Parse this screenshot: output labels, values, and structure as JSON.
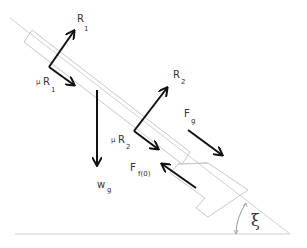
{
  "diagram": {
    "colors": {
      "outline": "#c8c8c8",
      "arrow": "#111111",
      "text": "#333333"
    },
    "angle_label": "ξ",
    "forces": [
      {
        "id": "R1",
        "main": "R",
        "sub": "1"
      },
      {
        "id": "muR1",
        "prefix": "μ",
        "main": "R",
        "sub": "1"
      },
      {
        "id": "wg",
        "main": "w",
        "sub": "g"
      },
      {
        "id": "R2",
        "main": "R",
        "sub": "2"
      },
      {
        "id": "muR2",
        "prefix": "μ",
        "main": "R",
        "sub": "2"
      },
      {
        "id": "Fg",
        "main": "F",
        "sub": "g"
      },
      {
        "id": "Ff0",
        "main": "F",
        "sub": "f(0)"
      }
    ]
  }
}
